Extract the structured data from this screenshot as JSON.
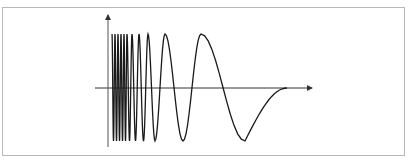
{
  "figure": {
    "colors": {
      "frame": "#b8b8b8",
      "axis": "#333333",
      "wave": "#1a1a1a",
      "background": "#ffffff"
    },
    "axes": {
      "x_axis": {
        "y": 88,
        "x_start": 95,
        "x_end": 312,
        "arrow": true
      },
      "y_axis": {
        "x": 108,
        "y_start": 147,
        "y_end": 15,
        "arrow": true
      },
      "x_label": "",
      "y_label": ""
    },
    "waveform": {
      "type": "chirp",
      "frequency_trend": "decreasing",
      "baseline_y": 88,
      "crest_y": 34,
      "trough_y": 141,
      "start_x": 112,
      "end_x": 287
    }
  }
}
